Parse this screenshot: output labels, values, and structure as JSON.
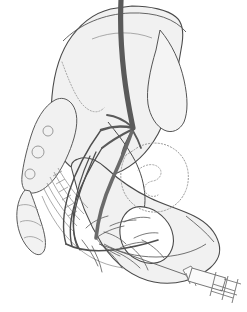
{
  "figure": {
    "domain": "anatomical line illustration",
    "background_color": "#ffffff",
    "canvas": {
      "width": 247,
      "height": 312
    }
  },
  "palette": {
    "bone_fill": "#f1f1f1",
    "bone_fill_light": "#f6f6f6",
    "bone_outline": "#4a4a4a",
    "bone_outline_soft": "#8a8a8a",
    "dotted_outline": "#9a9a9a",
    "vessel_dark": "#5a5a5a",
    "vessel_mid": "#6b6b6b",
    "nerve_dark": "#4f4f4f",
    "ligament_line": "#8f8f8f",
    "syringe_outline": "#6f6f6f",
    "syringe_fill": "#fbfbfb",
    "foramen_white": "#ffffff",
    "needle_line": "#5f5f5f"
  },
  "structures": {
    "ilium": {
      "name": "ilium-wing",
      "label": "Ilium (iliac wing / crest)",
      "fill": "#f1f1f1",
      "stroke": "#4a4a4a",
      "path": "M117,8 C100,10 84,20 72,36 C60,52 54,74 52,96 C50,118 52,136 58,150 C64,163 74,171 86,175 C96,178 107,177 117,173 C134,166 148,152 158,134 C165,121 170,106 173,92 C177,74 180,56 182,44 C184,31 182,22 176,17 C168,10 150,6 132,6 Z"
    },
    "ilium_upper_arc": {
      "name": "iliac-crest-arc",
      "label": "Iliac crest arc",
      "stroke": "#555555",
      "path": "M63,41 C80,24 104,14 130,13 C156,12 175,19 186,32"
    },
    "ilium_inner_arc": {
      "name": "iliac-fossa-arc",
      "label": "Iliac fossa inner arc",
      "stroke": "#8a8a8a",
      "path": "M92,39 C112,31 134,31 152,38"
    },
    "ilium_fossa_dotted": {
      "name": "iliac-fossa-dotted",
      "label": "Iliac fossa dotted margin",
      "stroke": "#9a9a9a",
      "path": "M62,62 C68,78 74,94 82,104 C90,113 98,114 104,108"
    },
    "posterior_ilium": {
      "name": "posterior-ilium-panel",
      "label": "Posterior ilium panel",
      "fill": "#f4f4f4",
      "stroke": "#555555",
      "path": "M160,30 C172,44 180,62 184,80 C188,98 188,112 184,122 C180,130 172,134 164,130 C156,126 150,116 148,104 C146,90 150,70 156,50 Z"
    },
    "sacrum": {
      "name": "sacrum",
      "label": "Sacrum",
      "fill": "#f1f1f1",
      "stroke": "#5a5a5a",
      "path": "M55,100 C44,106 36,120 31,136 C26,152 23,166 22,176 C21,186 24,192 30,193 C38,194 47,188 55,178 C63,167 70,152 74,138 C78,124 78,112 72,104 C67,98 61,97 55,100 Z"
    },
    "sacral_foramina": {
      "name": "sacral-foramina",
      "label": "Posterior sacral foramina",
      "stroke": "#8a8a8a",
      "circles": [
        {
          "cx": 48,
          "cy": 131,
          "r": 5
        },
        {
          "cx": 38,
          "cy": 152,
          "r": 6
        },
        {
          "cx": 30,
          "cy": 174,
          "r": 5
        }
      ]
    },
    "coccyx": {
      "name": "coccyx",
      "label": "Coccyx",
      "fill": "#f2f2f2",
      "stroke": "#5a5a5a",
      "path": "M25,190 C19,197 16,208 17,220 C18,232 23,243 30,250 C36,256 41,256 44,251 C47,245 45,234 41,222 C37,210 33,198 30,191 Z"
    },
    "coccyx_segments": {
      "name": "coccyx-segment-lines",
      "label": "Coccyx segment divisions",
      "stroke": "#8a8a8a",
      "paths": [
        "M18,206 C25,203 33,205 38,210",
        "M20,222 C27,219 35,221 41,226",
        "M24,238 C30,235 37,237 43,242"
      ]
    },
    "ischium_pubis": {
      "name": "ischium-pubis-body",
      "label": "Ischium and pubic ramus",
      "fill": "#f1f1f1",
      "stroke": "#4a4a4a",
      "path": "M72,170 C78,196 88,222 102,244 C116,265 134,278 154,282 C175,286 196,280 210,268 C218,261 221,252 219,244 C216,232 206,222 194,216 C180,209 164,205 150,198 C133,190 118,179 106,168 C96,159 86,156 78,159 C72,161 70,165 72,170 Z"
    },
    "obturator_foramen": {
      "name": "obturator-foramen",
      "label": "Obturator foramen",
      "fill": "#ffffff",
      "stroke": "#4a4a4a",
      "path": "M133,208 C124,212 119,222 120,234 C121,246 128,256 140,261 C152,266 164,263 170,253 C176,243 174,229 165,219 C156,209 143,204 133,208 Z"
    },
    "acetabulum_dotted": {
      "name": "acetabulum-dotted-outline",
      "label": "Acetabulum (dotted projection)",
      "stroke": "#9a9a9a",
      "path": "M126,155 C120,166 119,180 124,192 C130,205 143,213 157,212 C171,211 183,201 187,187 C191,172 186,157 174,149 C161,140 144,142 134,150 Z"
    },
    "acetabulum_inner_squiggle": {
      "name": "acetabulum-inner-notch",
      "label": "Acetabular notch detail",
      "stroke": "#9a9a9a",
      "path": "M138,170 C146,163 156,163 160,169 C163,174 159,180 153,181 C147,182 143,186 145,191 C147,196 153,198 158,195"
    },
    "greater_sciatic_notch": {
      "name": "greater-sciatic-notch",
      "label": "Greater sciatic notch",
      "stroke": "#4a4a4a",
      "path": "M108,122 C116,132 124,142 130,152 C137,163 142,175 144,188 C146,200 145,210 141,218"
    },
    "ischial_ramus_edge": {
      "name": "ischial-ramus-edge",
      "label": "Inferior ischiopubic ramus edge",
      "stroke": "#5a5a5a",
      "path": "M104,244 C118,252 136,257 156,257 C176,257 194,252 206,244"
    },
    "pubic_body_edge": {
      "name": "pubic-body-edge",
      "label": "Pubic body edge",
      "stroke": "#5a5a5a",
      "path": "M186,216 C196,224 206,232 214,242"
    }
  },
  "vessels": {
    "common_iliac_artery": {
      "name": "common-iliac-artery",
      "label": "Common iliac artery (descending trunk)",
      "color": "#5a5a5a",
      "width": 5.2,
      "path": "M121,0 C120,22 121,48 124,74 C127,100 131,118 133,128"
    },
    "internal_iliac_continuation": {
      "name": "internal-iliac-artery",
      "label": "Internal iliac artery continuation",
      "color": "#6b6b6b",
      "width": 3.6,
      "path": "M133,128 C128,144 120,162 112,180 C104,198 98,218 96,238"
    },
    "branches": [
      {
        "name": "vessel-branch-superior-gluteal",
        "label": "Superior gluteal branch",
        "color": "#5a5a5a",
        "width": 2.4,
        "path": "M133,128 C124,126 112,126 101,130"
      },
      {
        "name": "vessel-branch-lateral-sacral",
        "label": "Lateral sacral branch",
        "color": "#5a5a5a",
        "width": 2.0,
        "path": "M133,129 C123,134 112,140 102,148"
      },
      {
        "name": "vessel-branch-inferior-gluteal",
        "label": "Inferior gluteal branch",
        "color": "#5a5a5a",
        "width": 2.0,
        "path": "M133,130 C128,138 124,146 122,154"
      },
      {
        "name": "vessel-branch-obturator",
        "label": "Obturator branch",
        "color": "#5a5a5a",
        "width": 1.8,
        "path": "M133,131 C136,136 139,142 141,148"
      },
      {
        "name": "vessel-branch-iliolumbar",
        "label": "Iliolumbar branch",
        "color": "#5a5a5a",
        "width": 1.8,
        "path": "M131,126 C124,120 115,116 107,115"
      }
    ]
  },
  "nerves": {
    "plexus_trunks": [
      {
        "name": "nerve-trunk-l4",
        "label": "L4 contribution",
        "color": "#4f4f4f",
        "width": 1.4,
        "path": "M101,130 C88,148 76,170 69,192 C63,212 62,230 66,244"
      },
      {
        "name": "nerve-trunk-l5",
        "label": "L5 contribution",
        "color": "#4f4f4f",
        "width": 1.4,
        "path": "M102,148 C92,164 82,182 76,200 C70,218 69,234 72,246"
      },
      {
        "name": "nerve-trunk-s1",
        "label": "S1 root",
        "color": "#4f4f4f",
        "width": 1.3,
        "path": "M96,152 C88,170 80,188 76,206 C72,224 73,238 78,248"
      },
      {
        "name": "nerve-trunk-s2",
        "label": "S2 root",
        "color": "#4f4f4f",
        "width": 1.2,
        "path": "M90,156 C82,174 76,192 74,210 C72,226 74,240 80,250"
      },
      {
        "name": "nerve-sciatic-main",
        "label": "Sciatic nerve trunk",
        "color": "#4f4f4f",
        "width": 1.6,
        "path": "M66,244 C78,250 94,252 112,250 C130,248 146,244 158,240"
      }
    ],
    "fine_branches": [
      {
        "name": "nerve-branch-a",
        "path": "M96,238 C104,232 114,228 124,226"
      },
      {
        "name": "nerve-branch-b",
        "path": "M96,238 C102,246 110,252 120,256"
      },
      {
        "name": "nerve-branch-c",
        "path": "M100,244 C108,250 116,258 122,268"
      },
      {
        "name": "nerve-branch-d",
        "path": "M104,232 C112,234 120,238 126,244"
      },
      {
        "name": "nerve-branch-e",
        "path": "M110,226 C118,222 128,220 136,220"
      },
      {
        "name": "nerve-branch-f",
        "path": "M112,250 C122,254 132,260 140,268"
      },
      {
        "name": "nerve-branch-g",
        "path": "M120,248 C128,244 138,242 146,242"
      },
      {
        "name": "nerve-branch-h",
        "path": "M130,246 C138,252 144,260 148,270"
      },
      {
        "name": "nerve-branch-i",
        "path": "M86,228 C92,222 100,218 108,216"
      },
      {
        "name": "nerve-branch-j",
        "path": "M82,240 C88,248 94,256 98,266"
      },
      {
        "name": "nerve-branch-k",
        "path": "M142,240 C150,244 158,250 164,258"
      },
      {
        "name": "nerve-branch-l",
        "path": "M124,222 C132,218 142,216 150,218"
      },
      {
        "name": "nerve-branch-m",
        "path": "M92,246 C96,254 100,262 102,272"
      },
      {
        "name": "nerve-branch-n",
        "path": "M134,238 C142,234 150,232 158,233"
      }
    ],
    "color": "#4f4f4f"
  },
  "ligaments": {
    "name": "sacrotuberous-sacrospinous-ligaments",
    "label": "Sacrotuberous and sacrospinous ligaments (hatched)",
    "stroke": "#8f8f8f",
    "bands": [
      "M58,168 C66,182 76,196 88,208",
      "M54,172 C62,188 72,202 84,214",
      "M50,177 C58,193 68,208 80,220",
      "M47,183 C55,199 65,214 77,226",
      "M44,189 C52,205 62,220 74,232"
    ],
    "hatches": [
      "M53,176 L62,171",
      "M56,184 L65,179",
      "M59,192 L68,187",
      "M62,200 L71,195",
      "M65,208 L74,203",
      "M68,216 L77,211"
    ],
    "outer_band": "M42,196 C50,216 62,234 78,248 C92,260 108,266 124,268"
  },
  "injection": {
    "needle": {
      "name": "injection-needle",
      "label": "Injection needle shaft",
      "color": "#5f5f5f",
      "path": "M99,244 L186,275"
    },
    "needle_hub": {
      "name": "needle-hub",
      "label": "Needle hub",
      "color": "#6f6f6f",
      "path": "M183,270 L190,282 L198,277 L191,266 Z"
    },
    "barrel": {
      "name": "syringe-barrel",
      "label": "Syringe barrel",
      "fill": "#fbfbfb",
      "stroke": "#6f6f6f",
      "path": "M192,268 L226,278 L222,291 L188,281 Z"
    },
    "barrel_graduations": [
      "M186,273 L190,284",
      "M192,274 L196,286"
    ],
    "plunger_rod": {
      "name": "syringe-plunger-rod",
      "label": "Syringe plunger rod",
      "stroke": "#6f6f6f",
      "paths": [
        "M224,279 L241,284",
        "M220,290 L237,295"
      ]
    },
    "plunger_flange": {
      "name": "syringe-plunger-flange",
      "label": "Syringe plunger flange / thumb rest",
      "stroke": "#6f6f6f",
      "paths": [
        "M216,272 L210,296",
        "M228,276 L222,300",
        "M238,279 L232,303"
      ]
    },
    "flange_crossbars": [
      "M213,284 L235,291",
      "M211,291 L233,298"
    ]
  },
  "annotations": {
    "visible_text": [],
    "note": "No text labels appear in this illustration."
  }
}
